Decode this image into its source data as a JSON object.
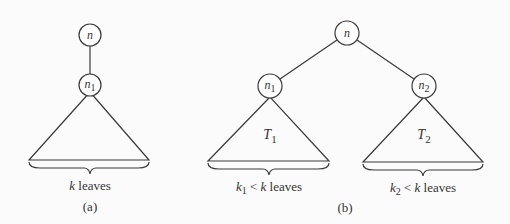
{
  "figure_a": {
    "caption": "(a)",
    "root": {
      "label": "n"
    },
    "child": {
      "label": "n",
      "sub": "1"
    },
    "leaves": {
      "var": "k",
      "text": " leaves"
    }
  },
  "figure_b": {
    "caption": "(b)",
    "root": {
      "label": "n"
    },
    "left": {
      "label": "n",
      "sub": "1",
      "tree": "T",
      "tree_sub": "1",
      "leaves": {
        "var": "k",
        "sub": "1",
        "rel": " < ",
        "var2": "k",
        "text": " leaves"
      }
    },
    "right": {
      "label": "n",
      "sub": "2",
      "tree": "T",
      "tree_sub": "2",
      "leaves": {
        "var": "k",
        "sub": "2",
        "rel": " < ",
        "var2": "k",
        "text": " leaves"
      }
    }
  },
  "colors": {
    "line": "#3a3a3a",
    "background": "#fbfbfb"
  }
}
